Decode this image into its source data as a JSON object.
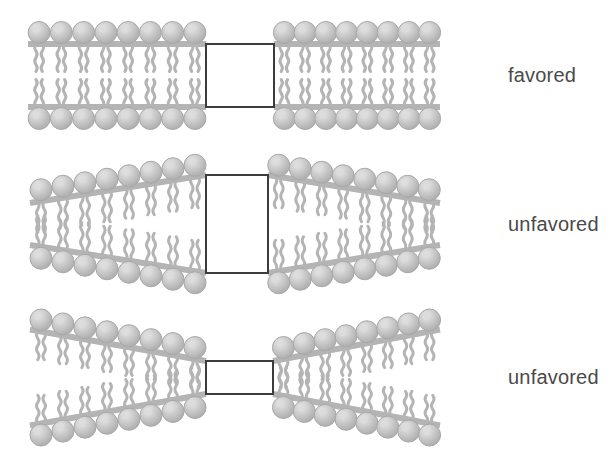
{
  "figure": {
    "background_color": "#ffffff",
    "lipid_color": "#b4b4b4",
    "lipid_highlight_color": "#dcdcdc",
    "lipid_outline_color": "#a8a8a8",
    "protein_fill_color": "#ffffff",
    "protein_stroke_color": "#3c3c3c",
    "label_color": "#4a4a4a"
  },
  "panels": [
    {
      "id": "panel-1",
      "label": "favored",
      "state": "matched",
      "description": "Bilayer thickness matches protein hydrophobic length; membrane stays flat.",
      "protein": {
        "x": 206,
        "y": 44,
        "width": 68,
        "height": 63,
        "shape": "square"
      },
      "bilayer": {
        "left_inner_half_thickness": 31.5,
        "left_outer_half_thickness": 31.5,
        "right_inner_half_thickness": 31.5,
        "right_outer_half_thickness": 31.5,
        "center_y": 75.5,
        "left_start_x": 28,
        "left_end_x": 206,
        "right_start_x": 274,
        "right_end_x": 440,
        "left_lipid_count": 8,
        "right_lipid_count": 8
      },
      "label_position": {
        "x": 508,
        "y": 82
      }
    },
    {
      "id": "panel-2",
      "label": "unfavored",
      "state": "stretched",
      "description": "Protein is thicker than the bilayer; lipids stretch near the protein, thinning outward.",
      "protein": {
        "x": 206,
        "y": 175,
        "width": 62,
        "height": 98,
        "shape": "tall-rectangle"
      },
      "bilayer": {
        "left_inner_half_thickness": 49,
        "left_outer_half_thickness": 21,
        "right_inner_half_thickness": 49,
        "right_outer_half_thickness": 21,
        "center_y": 224,
        "left_start_x": 30,
        "left_end_x": 206,
        "right_start_x": 268,
        "right_end_x": 440,
        "left_lipid_count": 8,
        "right_lipid_count": 8
      },
      "label_position": {
        "x": 508,
        "y": 231
      }
    },
    {
      "id": "panel-3",
      "label": "unfavored",
      "state": "compressed",
      "description": "Protein is thinner than the bilayer; lipids compress near the protein, thickening outward.",
      "protein": {
        "x": 206,
        "y": 361,
        "width": 67,
        "height": 33,
        "shape": "wide-rectangle"
      },
      "bilayer": {
        "left_inner_half_thickness": 16.5,
        "left_outer_half_thickness": 48,
        "right_inner_half_thickness": 16.5,
        "right_outer_half_thickness": 48,
        "center_y": 377.5,
        "left_start_x": 30,
        "left_end_x": 206,
        "right_start_x": 273,
        "right_end_x": 440,
        "left_lipid_count": 8,
        "right_lipid_count": 8
      },
      "label_position": {
        "x": 508,
        "y": 384
      }
    }
  ],
  "chart_data": {
    "type": "diagram",
    "categories": [
      "matched",
      "stretched",
      "compressed"
    ],
    "series": [
      {
        "name": "energetic preference",
        "values": [
          "favored",
          "unfavored",
          "unfavored"
        ]
      }
    ],
    "annotations": [
      "favored",
      "unfavored",
      "unfavored"
    ]
  }
}
